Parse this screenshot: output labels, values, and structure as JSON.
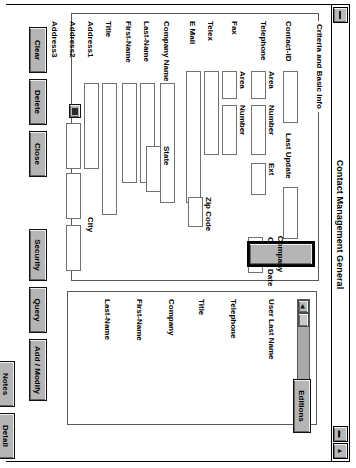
{
  "window": {
    "title": "Contact Management General",
    "sysmenu_icon": "system-menu-icon",
    "minimize_label": "▬",
    "maximize_label": "▲"
  },
  "group": {
    "legend": "Criteria and Basic Info"
  },
  "labels": {
    "contact_id": "Contact-ID",
    "last_update": "Last Update",
    "telephone": "Telephone",
    "tel_area": "Area",
    "tel_number": "Number",
    "tel_ext": "Ext",
    "fax": "Fax",
    "fax_area": "Area",
    "fax_number": "Number",
    "telex": "Telex",
    "email": "E Mail",
    "company_name": "Company Name",
    "last_name": "Last-Name",
    "first_name": "First-Name",
    "title": "Title",
    "address1": "Address1",
    "address2": "Address2",
    "address3": "Address3",
    "city": "City",
    "state": "State",
    "zip_code": "Zip Code",
    "contact_date": "Contact Date"
  },
  "fields": {
    "contact_id": "",
    "last_update": "",
    "tel_area": "",
    "tel_number": "",
    "tel_ext": "",
    "fax_area": "",
    "fax_number": "",
    "telex": "",
    "email": "",
    "company_name": "",
    "last_name": "",
    "first_name": "",
    "title": "",
    "address1": "",
    "address2": "",
    "address3": "",
    "city": "",
    "state": "",
    "zip_code": "",
    "contact_date": ""
  },
  "buttons": {
    "company": "Company",
    "clear": "Clear",
    "delete": "Delete",
    "close": "Close",
    "security": "Security",
    "query": "Query",
    "add_modify": "Add / Modify",
    "notes": "Notes",
    "detail": "Detail",
    "editions": "Editions",
    "lookup_icon": "lookup-icon"
  },
  "list": {
    "columns": [
      "Last-Name",
      "First-Name",
      "Company",
      "Title",
      "Telephone",
      "User Last Name"
    ],
    "rows": [],
    "scrollbar": {
      "left_arrow": "◀",
      "right_arrow": "▶"
    }
  },
  "colors": {
    "window_bg": "#ffffff",
    "button_face": "#b5b5b5",
    "border": "#000000",
    "field_border": "#707070"
  }
}
